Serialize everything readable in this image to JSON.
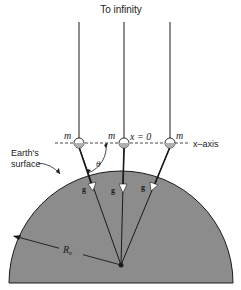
{
  "title": "To infinity",
  "labels": {
    "mass_left": "m",
    "mass_center": "m",
    "mass_right": "m",
    "origin": "x = 0",
    "axis": "x–axis",
    "surface_line1": "Earth's",
    "surface_line2": "surface",
    "angle": "θ",
    "g_left": "g",
    "g_center": "g",
    "g_right": "g",
    "radius": "R",
    "radius_sub": "e"
  },
  "colors": {
    "earth_fill": "#8c8c8c",
    "line": "#1a1a1a",
    "background": "#ffffff"
  }
}
